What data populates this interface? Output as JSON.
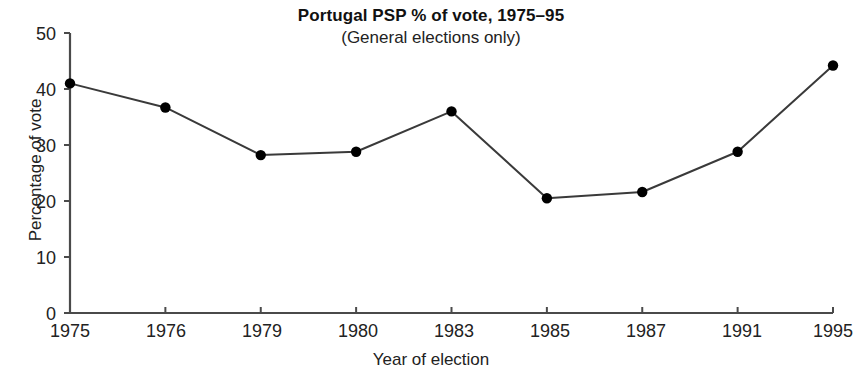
{
  "chart_data": {
    "type": "line",
    "title": "Portugal PSP % of vote, 1975–95",
    "subtitle": "(General elections only)",
    "xlabel": "Year of election",
    "ylabel": "Percentage of vote",
    "categories": [
      "1975",
      "1976",
      "1979",
      "1980",
      "1983",
      "1985",
      "1987",
      "1991",
      "1995"
    ],
    "values": [
      41,
      36.7,
      28.2,
      28.8,
      36,
      20.5,
      21.6,
      28.8,
      44.2
    ],
    "series": [
      {
        "name": "PSP share of vote",
        "values": [
          41,
          36.7,
          28.2,
          28.8,
          36,
          20.5,
          21.6,
          28.8,
          44.2
        ]
      }
    ],
    "ylim": [
      0,
      50
    ],
    "yticks": [
      0,
      10,
      20,
      30,
      40,
      50
    ],
    "ytick_labels": [
      "0",
      "10",
      "20",
      "30",
      "40",
      "50"
    ],
    "xtick_labels": [
      "1975",
      "1976",
      "1979",
      "1980",
      "1983",
      "1985",
      "1987",
      "1991",
      "1995"
    ],
    "grid": false,
    "legend": "none",
    "marker": "circle",
    "marker_color": "#000000",
    "line_color": "#3a3a3a",
    "background_color": "#ffffff"
  }
}
